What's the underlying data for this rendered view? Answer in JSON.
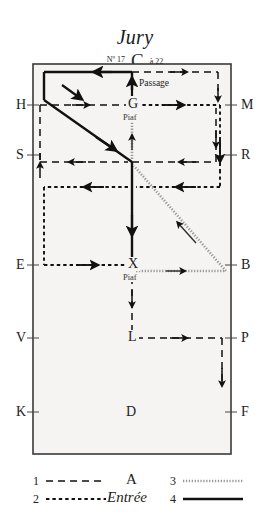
{
  "header": {
    "title": "Jury",
    "number_prefix": "Nº",
    "number": "17",
    "letter": "C",
    "range_text": "à 22"
  },
  "arena": {
    "left_letters": [
      {
        "id": "H",
        "label": "H",
        "y": 105
      },
      {
        "id": "S",
        "label": "S",
        "y": 155
      },
      {
        "id": "E",
        "label": "E",
        "y": 265
      },
      {
        "id": "V",
        "label": "V",
        "y": 338
      },
      {
        "id": "K",
        "label": "K",
        "y": 412
      }
    ],
    "right_letters": [
      {
        "id": "M",
        "label": "M",
        "y": 105
      },
      {
        "id": "R",
        "label": "R",
        "y": 155
      },
      {
        "id": "B",
        "label": "B",
        "y": 265
      },
      {
        "id": "P",
        "label": "P",
        "y": 338
      },
      {
        "id": "F",
        "label": "F",
        "y": 412
      }
    ],
    "inner_letters": [
      {
        "id": "G",
        "label": "G",
        "x": 132,
        "y": 105
      },
      {
        "id": "X",
        "label": "X",
        "x": 132,
        "y": 265
      },
      {
        "id": "L",
        "label": "L",
        "x": 132,
        "y": 338
      },
      {
        "id": "D",
        "label": "D",
        "x": 132,
        "y": 412
      }
    ],
    "annotations": [
      {
        "id": "passage-top",
        "label": "Passage",
        "x": 138,
        "y": 86
      },
      {
        "id": "piaf-g",
        "label": "Piaf",
        "x": 132,
        "y": 117
      },
      {
        "id": "piaf-x",
        "label": "Piaf",
        "x": 132,
        "y": 277
      }
    ]
  },
  "legend": {
    "items": [
      {
        "num": "1",
        "style": "long-dash"
      },
      {
        "num": "2",
        "style": "short-dash"
      },
      {
        "num": "3",
        "style": "dotted"
      },
      {
        "num": "4",
        "style": "solid"
      }
    ],
    "center_top": "A",
    "center_bottom": "Entrée"
  },
  "colors": {
    "ink": "#1a1a1a",
    "arena_fill": "#f5f4f2",
    "arena_border": "#3a3a3a"
  }
}
